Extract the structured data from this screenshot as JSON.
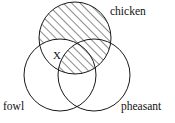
{
  "diagram": {
    "kind": "venn-diagram",
    "title": "",
    "canvas": {
      "width": 175,
      "height": 123,
      "background": "#ffffff"
    },
    "stroke_color": "#1a1a1a",
    "hatch_color": "#1a1a1a",
    "label_color": "#111111",
    "sets": [
      {
        "id": "chicken",
        "label": "chicken",
        "cx": 75,
        "cy": 38,
        "r": 36,
        "label_x": 110,
        "label_y": 15,
        "label_anchor": "start"
      },
      {
        "id": "fowl",
        "label": "fowl",
        "cx": 60,
        "cy": 75,
        "r": 36,
        "label_x": 3,
        "label_y": 110,
        "label_anchor": "start"
      },
      {
        "id": "pheasant",
        "label": "pheasant",
        "cx": 94,
        "cy": 75,
        "r": 36,
        "label_x": 121,
        "label_y": 110,
        "label_anchor": "start"
      }
    ],
    "markers": [
      {
        "id": "x-marker",
        "label": "X",
        "x": 53,
        "y": 59,
        "region": "chicken and fowl, not pheasant"
      }
    ],
    "shading": {
      "style": "diagonal-hatch",
      "direction": "lower-left-to-upper-right",
      "spacing_px": 6,
      "line_width": 1,
      "color": "#1a1a1a",
      "shaded_region": "chicken minus (chicken intersect fowl minus pheasant)",
      "description": "The chicken circle is hatched everywhere except the lens where chicken overlaps fowl outside pheasant, which contains the X."
    }
  }
}
